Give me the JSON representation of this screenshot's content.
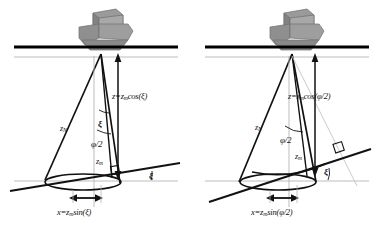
{
  "figure": {
    "type": "two-panel-schematic",
    "panel_count": 2,
    "background_color": "#ffffff",
    "line_color": "#111111",
    "vessel_color": "#8c8c8c",
    "guide_color": "#b5b5b5"
  },
  "panels": [
    {
      "id": "left",
      "case_label": "sloped-seafloor-angle",
      "vessel": "ship-icon",
      "surface_label": "water-surface-line",
      "labels": {
        "slant_range": "z",
        "slant_range_sub": "N",
        "beam_half_angle": "ξ",
        "beam_half_angle2": "φ/2",
        "min_range": "z",
        "min_range_sub": "m",
        "seafloor_angle": "ξ",
        "depth_formula": "z=z",
        "depth_formula_sub": "m",
        "depth_formula_tail": "cos(ξ)",
        "offset_formula": "x=z",
        "offset_formula_sub": "m",
        "offset_formula_tail": "sin(ξ)"
      }
    },
    {
      "id": "right",
      "case_label": "beam-width-angle",
      "vessel": "ship-icon",
      "surface_label": "water-surface-line",
      "labels": {
        "slant_range": "z",
        "slant_range_sub": "N",
        "beam_half_angle2": "φ/2",
        "min_range": "z",
        "min_range_sub": "m",
        "seafloor_angle": "ξ",
        "depth_formula": "z=z",
        "depth_formula_sub": "m",
        "depth_formula_tail": "cos(φ/2)",
        "offset_formula": "x=z",
        "offset_formula_sub": "m",
        "offset_formula_tail": "sin(φ/2)"
      }
    }
  ]
}
